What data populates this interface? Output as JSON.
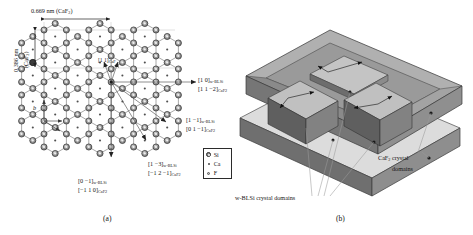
{
  "figure": {
    "panel_a_label": "(a)",
    "panel_b_label": "(b)"
  },
  "panel_a": {
    "dimensions": {
      "horizontal": "0.669 nm (CaF",
      "horizontal_sub": "2",
      "horizontal_tail": ")",
      "vertical_line1": "0.386 nm",
      "vertical_line2": "(CaF",
      "vertical_sub": "2",
      "vertical_tail": ")"
    },
    "lattice_vector_label": "b",
    "origin_label": {
      "text": "[1 1]",
      "subscript": "CaF"
    },
    "directions": [
      {
        "id": "right",
        "line1_main": "[1 0]",
        "line1_sub": "w-BLSi",
        "line2_main": "[1 1 −2]",
        "line2_sub": "CaF2"
      },
      {
        "id": "lower-right",
        "line1_main": "[1 −1]",
        "line1_sub": "w-BLSi",
        "line2_main": "[0 1 −1]",
        "line2_sub": "CaF2"
      },
      {
        "id": "lower-right-far",
        "line1_main": "[1 −3]",
        "line1_sub": "w-BLSi",
        "line2_main": "[−1 2 −1]",
        "line2_sub": "CaF2"
      },
      {
        "id": "down",
        "line1_main": "[0 −1]",
        "line1_sub": "w-BLSi",
        "line2_main": "[−1 1 0]",
        "line2_sub": "CaF2"
      }
    ],
    "legend": [
      {
        "symbol": "si",
        "label": "Si",
        "sub": ""
      },
      {
        "symbol": "ca",
        "label": "Ca",
        "sub": ""
      },
      {
        "symbol": "f",
        "label": "F",
        "sub": ""
      }
    ],
    "colors": {
      "si_atom": "#8d8d8d",
      "ca_atom": "#4a4a4a",
      "f_atom": "#bdbdbd",
      "bond": "#6f6f6f",
      "guide": "#b8b8b8"
    }
  },
  "panel_b": {
    "annotations": [
      {
        "id": "blsi-domains",
        "text": "w-BLSi crystal domains"
      },
      {
        "id": "caf2-domains-l1",
        "text": "CaF",
        "sub": "2",
        "tail": " crystal"
      },
      {
        "id": "caf2-domains-l2",
        "text": "domains"
      }
    ],
    "colors": {
      "top_face": "#a9a9a9",
      "side_face": "#757575",
      "front_face": "#8c8c8c",
      "lower_top": "#d8d8d8",
      "lower_side": "#6e6e6e",
      "domain_top": "#bdbdbd",
      "domain_side": "#5e5e5e",
      "leader": "#8a8a8a"
    }
  }
}
